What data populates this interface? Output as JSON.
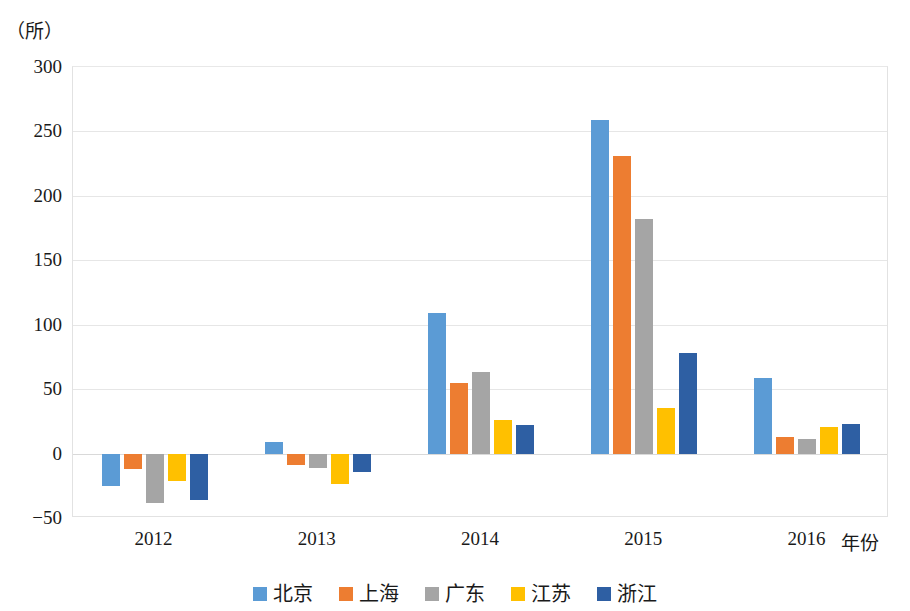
{
  "chart_data": {
    "type": "bar",
    "title": "",
    "subtitle": "",
    "xlabel": "年份",
    "ylabel": "（所）",
    "unit_label": "（所）",
    "categories": [
      "2012",
      "2013",
      "2014",
      "2015",
      "2016"
    ],
    "series": [
      {
        "name": "北京",
        "color": "#5B9BD5",
        "values": [
          -25,
          9,
          109,
          259,
          59
        ]
      },
      {
        "name": "上海",
        "color": "#ED7D31",
        "values": [
          -12,
          -9,
          55,
          231,
          13
        ]
      },
      {
        "name": "广东",
        "color": "#A5A5A5",
        "values": [
          -38,
          -11,
          63,
          182,
          11
        ]
      },
      {
        "name": "江苏",
        "color": "#FFC000",
        "values": [
          -21,
          -24,
          26,
          35,
          21
        ]
      },
      {
        "name": "浙江",
        "color": "#2E5FA3",
        "values": [
          -36,
          -14,
          22,
          78,
          23
        ]
      }
    ],
    "ylim": [
      -50,
      300
    ],
    "yticks": [
      "300",
      "250",
      "200",
      "150",
      "100",
      "50",
      "0",
      "−50"
    ],
    "ytick_values": [
      300,
      250,
      200,
      150,
      100,
      50,
      0,
      -50
    ],
    "gridlines": true,
    "legend_position": "bottom",
    "legend_entries": [
      "北京",
      "上海",
      "广东",
      "江苏",
      "浙江"
    ]
  }
}
